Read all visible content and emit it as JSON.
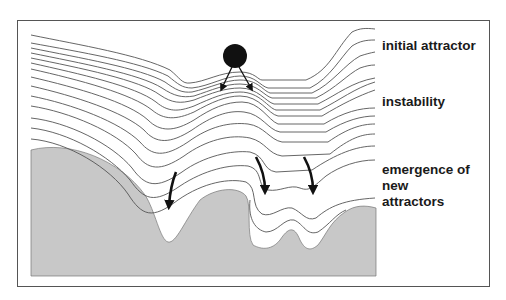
{
  "labels": {
    "initial_attractor": "initial attractor",
    "instability": "instability",
    "emergence_line1": "emergence of",
    "emergence_line2": "new",
    "emergence_line3": "attractors"
  },
  "colors": {
    "frame": "#555555",
    "contour": "#555555",
    "ground_fill": "#c8c8c8",
    "ball": "#111111",
    "arrow": "#111111",
    "text": "#1a1a1a"
  }
}
